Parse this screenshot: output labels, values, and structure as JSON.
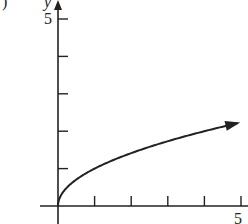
{
  "chart_data": {
    "type": "line",
    "title": "",
    "xlabel": "",
    "ylabel": "y",
    "xlim": [
      0,
      5
    ],
    "ylim": [
      0,
      5
    ],
    "x_ticks": [
      1,
      2,
      3,
      4,
      5
    ],
    "y_ticks": [
      1,
      2,
      3,
      4,
      5
    ],
    "x_tick_labels_shown": [
      "5"
    ],
    "y_tick_labels_shown": [
      "5"
    ],
    "grid": false,
    "series": [
      {
        "name": "y = sqrt(x)",
        "x": [
          0,
          0.25,
          0.5,
          1,
          1.5,
          2,
          2.5,
          3,
          3.5,
          4,
          4.5,
          4.9
        ],
        "values": [
          0,
          0.5,
          0.71,
          1,
          1.22,
          1.41,
          1.58,
          1.73,
          1.87,
          2,
          2.12,
          2.21
        ],
        "arrow_at_end": true
      }
    ]
  },
  "labels": {
    "part_marker": ")",
    "y_axis": "y",
    "y_max": "5",
    "x_max": "5"
  }
}
